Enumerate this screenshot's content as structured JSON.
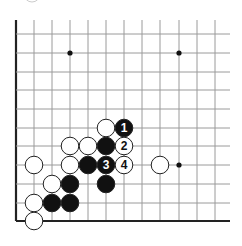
{
  "diagram": {
    "type": "go-board-fragment",
    "colors": {
      "background": "#ffffff",
      "grid_line": "#9a9a9a",
      "edge_line": "#222222",
      "black_stone": "#111111",
      "white_stone": "#ffffff",
      "stone_outline": "#222222",
      "star_point": "#111111"
    },
    "grid": {
      "columns_x": [
        16,
        34,
        52,
        70,
        88,
        106,
        124,
        142,
        160,
        179,
        197,
        215
      ],
      "rows_y": [
        34,
        53,
        72,
        90,
        109,
        128,
        146,
        165,
        184,
        203,
        221
      ],
      "right_extent_x": 230,
      "top_extent_y": 20,
      "left_edge_thick": true,
      "bottom_edge_thick": true
    },
    "star_points": [
      {
        "col": 3,
        "row": 1
      },
      {
        "col": 9,
        "row": 1
      },
      {
        "col": 9,
        "row": 7
      }
    ],
    "stones": [
      {
        "color": "white",
        "col": 5,
        "row": 5,
        "label": ""
      },
      {
        "color": "black",
        "col": 6,
        "row": 5,
        "label": "1"
      },
      {
        "color": "white",
        "col": 3,
        "row": 6,
        "label": ""
      },
      {
        "color": "white",
        "col": 4,
        "row": 6,
        "label": ""
      },
      {
        "color": "black",
        "col": 5,
        "row": 6,
        "label": ""
      },
      {
        "color": "white",
        "col": 6,
        "row": 6,
        "label": "2"
      },
      {
        "color": "white",
        "col": 1,
        "row": 7,
        "label": ""
      },
      {
        "color": "white",
        "col": 3,
        "row": 7,
        "label": ""
      },
      {
        "color": "black",
        "col": 4,
        "row": 7,
        "label": ""
      },
      {
        "color": "black",
        "col": 5,
        "row": 7,
        "label": "3"
      },
      {
        "color": "white",
        "col": 6,
        "row": 7,
        "label": "4"
      },
      {
        "color": "white",
        "col": 8,
        "row": 7,
        "label": ""
      },
      {
        "color": "white",
        "col": 2,
        "row": 8,
        "label": ""
      },
      {
        "color": "black",
        "col": 3,
        "row": 8,
        "label": ""
      },
      {
        "color": "black",
        "col": 5,
        "row": 8,
        "label": ""
      },
      {
        "color": "white",
        "col": 1,
        "row": 9,
        "label": ""
      },
      {
        "color": "black",
        "col": 2,
        "row": 9,
        "label": ""
      },
      {
        "color": "black",
        "col": 3,
        "row": 9,
        "label": ""
      },
      {
        "color": "white",
        "col": 1,
        "row": 10,
        "label": ""
      }
    ],
    "move_labels": [
      "1",
      "2",
      "3",
      "4"
    ]
  }
}
